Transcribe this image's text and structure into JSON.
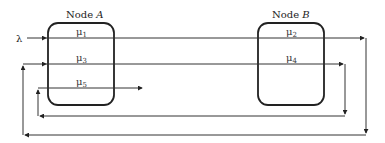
{
  "diagram": {
    "input": {
      "label": "λ"
    },
    "nodes": [
      {
        "id": "A",
        "label_prefix": "Node ",
        "label_var": "A",
        "rates": [
          "μ1",
          "μ3",
          "μ5"
        ]
      },
      {
        "id": "B",
        "label_prefix": "Node ",
        "label_var": "B",
        "rates": [
          "μ2",
          "μ4"
        ]
      }
    ],
    "rates": [
      {
        "base": "μ",
        "sub": "1"
      },
      {
        "base": "μ",
        "sub": "2"
      },
      {
        "base": "μ",
        "sub": "3"
      },
      {
        "base": "μ",
        "sub": "4"
      },
      {
        "base": "μ",
        "sub": "5"
      }
    ],
    "flows": [
      {
        "from": "λ",
        "to": "μ1 (Node A)"
      },
      {
        "from": "μ1 (Node A)",
        "to": "μ2 (Node B)"
      },
      {
        "from": "μ2 (Node B)",
        "to": "μ3 (Node A)",
        "route": "feedback outer loop"
      },
      {
        "from": "μ3 (Node A)",
        "to": "μ4 (Node B)"
      },
      {
        "from": "μ4 (Node B)",
        "to": "μ5 (Node A)",
        "route": "feedback inner loop"
      },
      {
        "from": "μ5 (Node A)",
        "to": "exit"
      }
    ]
  }
}
